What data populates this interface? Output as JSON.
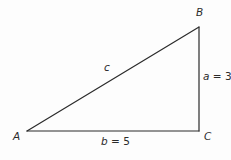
{
  "figure": {
    "type": "right-triangle-diagram",
    "width": 231,
    "height": 160,
    "background_color": "#fdfdfd",
    "line_color": "#2b2b2b",
    "text_color": "#2b2b2b"
  },
  "vertices": {
    "A": {
      "label": "A",
      "x": 27,
      "y": 131
    },
    "B": {
      "label": "B",
      "x": 199,
      "y": 27
    },
    "C": {
      "label": "C",
      "x": 199,
      "y": 131
    }
  },
  "sides": {
    "hypotenuse": {
      "name": "c",
      "label": "c",
      "var": "c",
      "value_text": "",
      "from": "A",
      "to": "B"
    },
    "opposite": {
      "name": "a",
      "label": "a = 3",
      "var": "a",
      "value_text": " = 3",
      "value": 3,
      "from": "B",
      "to": "C"
    },
    "adjacent": {
      "name": "b",
      "label": "b = 5",
      "var": "b",
      "value_text": " = 5",
      "value": 5,
      "from": "A",
      "to": "C"
    }
  }
}
